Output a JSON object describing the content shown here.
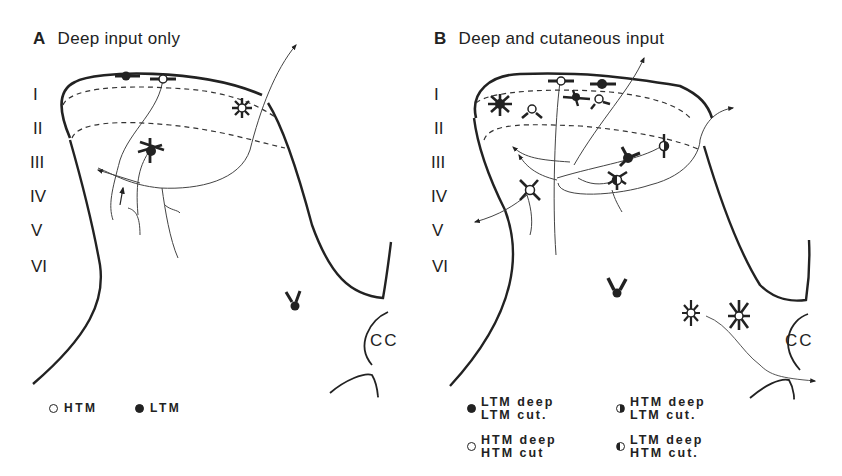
{
  "panel_a": {
    "letter": "A",
    "title": "Deep input only",
    "laminae": [
      "I",
      "II",
      "III",
      "IV",
      "V",
      "VI"
    ],
    "cc_label": "CC",
    "legend": [
      {
        "symbol": "open-circle",
        "label": "HTM"
      },
      {
        "symbol": "filled-circle",
        "label": "LTM"
      }
    ]
  },
  "panel_b": {
    "letter": "B",
    "title": "Deep and cutaneous input",
    "laminae": [
      "I",
      "II",
      "III",
      "IV",
      "V",
      "VI"
    ],
    "cc_label": "CC",
    "legend": [
      {
        "symbol": "filled-circle",
        "line1": "LTM deep",
        "line2": "LTM cut."
      },
      {
        "symbol": "half-filled-right",
        "line1": "HTM deep",
        "line2": "LTM cut."
      },
      {
        "symbol": "open-circle",
        "line1": "HTM deep",
        "line2": "HTM cut"
      },
      {
        "symbol": "half-filled-left",
        "line1": "LTM deep",
        "line2": "HTM cut."
      }
    ]
  }
}
